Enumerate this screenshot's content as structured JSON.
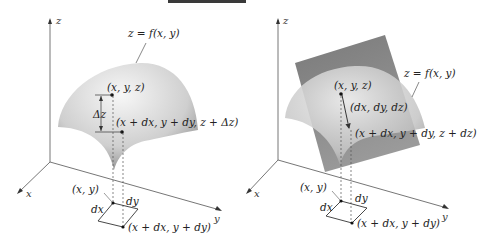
{
  "figure": {
    "panels": [
      {
        "id": "left",
        "title": "Actual change Δz along surface",
        "axes": {
          "x": "x",
          "y": "y",
          "z": "z"
        },
        "labels": {
          "surface": "z = f(x, y)",
          "point": "(x, y, z)",
          "delta_z": "Δz",
          "shifted_point": "(x + dx, y + dy, z + Δz)",
          "base_point": "(x, y)",
          "dx": "dx",
          "dy": "dy",
          "base_shifted": "(x + dx, y + dy)"
        }
      },
      {
        "id": "right",
        "title": "Change dz along tangent plane",
        "axes": {
          "x": "x",
          "y": "y",
          "z": "z"
        },
        "labels": {
          "surface": "z = f(x, y)",
          "point": "(x, y, z)",
          "vector": "(dx, dy, dz)",
          "shifted_point": "(x + dx, y + dy, z + dz)",
          "base_point": "(x, y)",
          "dx": "dx",
          "dy": "dy",
          "base_shifted": "(x + dx, y + dy)"
        }
      }
    ],
    "colors": {
      "surface_light": "#f2f2f2",
      "surface_dark": "#8c8c8c",
      "plane": "#7d7d7d",
      "axis": "#555555",
      "text": "#222222"
    }
  }
}
